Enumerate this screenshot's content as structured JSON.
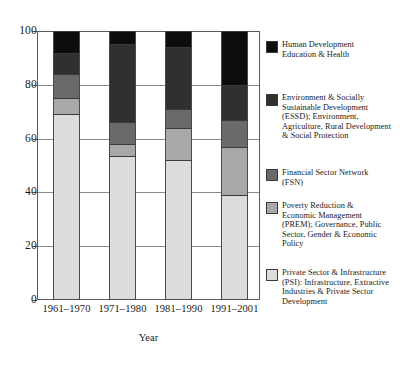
{
  "chart_data": {
    "type": "bar",
    "subtype": "stacked-100-percent",
    "title": "",
    "xlabel": "Year",
    "ylabel": "",
    "ylim": [
      0,
      100
    ],
    "yticks": [
      0,
      20,
      40,
      60,
      80,
      100
    ],
    "ytick_labels": [
      "0",
      "20",
      "40",
      "60",
      "80",
      "100"
    ],
    "grid": true,
    "legend_position": "right",
    "categories": [
      "1961–1970",
      "1971–1980",
      "1981–1990",
      "1991–2001"
    ],
    "series": [
      {
        "name": "Human Development Education & Health",
        "legend_label": "Human Development\nEducation & Health",
        "color": "#0d0d0d",
        "values": [
          8,
          5,
          6,
          20
        ]
      },
      {
        "name": "Environment & Socially Sustainable Development (ESSD)",
        "legend_label": "Environment & Socially\nSustainable Development\n(ESSD); Environment,\nAgriculture, Rural Development\n& Social Protection",
        "color": "#303030",
        "values": [
          8,
          29,
          23,
          13
        ]
      },
      {
        "name": "Financial Sector Network (FSN)",
        "legend_label": "Financial Sector Network\n(FSN)",
        "color": "#6a6a6a",
        "values": [
          9,
          8,
          7,
          10
        ]
      },
      {
        "name": "Poverty Reduction & Economic Management (PREM)",
        "legend_label": "Poverty Reduction &\nEconomic Management\n(PREM); Governance, Public\nSector, Gender & Economic\nPolicy",
        "color": "#a8a8a8",
        "values": [
          6,
          4.5,
          12,
          18
        ]
      },
      {
        "name": "Private Sector & Infrastructure (PSI)",
        "legend_label": "Private Sector & Infrastructure\n(PSI): Infrastructure, Extractive\nIndustries & Private Sector\nDevelopment",
        "color": "#dcdcdc",
        "values": [
          69,
          53.5,
          52,
          39
        ]
      }
    ],
    "cumulative_tops": {
      "1961–1970": {
        "PSI": 69,
        "PREM": 75,
        "FSN": 84,
        "ESSD": 92,
        "HD": 100
      },
      "1971–1980": {
        "PSI": 53.5,
        "PREM": 58,
        "FSN": 66,
        "ESSD": 95,
        "HD": 100
      },
      "1981–1990": {
        "PSI": 52,
        "PREM": 64,
        "FSN": 71,
        "ESSD": 94,
        "HD": 100
      },
      "1991–2001": {
        "PSI": 39,
        "PREM": 57,
        "FSN": 67,
        "ESSD": 80,
        "HD": 100
      }
    }
  },
  "axes": {
    "x_title": "Year"
  },
  "colors": {
    "human_development": "#0d0d0d",
    "essd": "#303030",
    "fsn": "#6a6a6a",
    "prem": "#a8a8a8",
    "psi": "#dcdcdc",
    "frame": "#5a5a5a",
    "gridline": "#8a8a8a",
    "background": "#ffffff"
  }
}
